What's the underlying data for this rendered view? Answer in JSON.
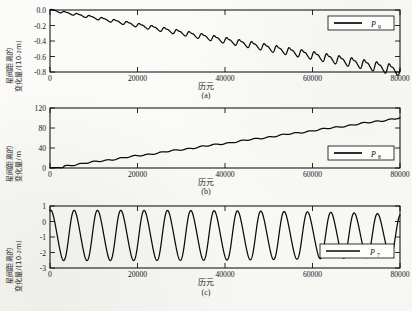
{
  "figure": {
    "background": "#fbfbf9",
    "line_color": "#0a0a0a",
    "xlabel": "历元",
    "captions": {
      "a": "(a)",
      "b": "(b)",
      "c": "(c)"
    }
  },
  "axis": {
    "xticks": [
      "0",
      "20000",
      "40000",
      "60000",
      "80000"
    ],
    "xlim": [
      0,
      80000
    ]
  },
  "panels": {
    "a": {
      "caption": "(a)",
      "xlabel": "历元",
      "ylabel_line1": "星间距离的",
      "ylabel_line2_prefix": "变化量/(10",
      "ylabel_line2_exp": "-2",
      "ylabel_line2_suffix": "m)",
      "yticks": [
        "0.0",
        "-0.2",
        "-0.4",
        "-0.6",
        "-0.8"
      ],
      "legend": {
        "symbol": "P",
        "subscript": "9"
      }
    },
    "b": {
      "caption": "(b)",
      "xlabel": "历元",
      "ylabel_line1": "星间距离的",
      "ylabel_line2_prefix": "变化量/m",
      "ylabel_line2_exp": "",
      "ylabel_line2_suffix": "",
      "yticks": [
        "120",
        "80",
        "40",
        "0"
      ],
      "legend": {
        "symbol": "P",
        "subscript": "8"
      }
    },
    "c": {
      "caption": "(c)",
      "xlabel": "历元",
      "ylabel_line1": "星间距离的",
      "ylabel_line2_prefix": "变化量/(10",
      "ylabel_line2_exp": "-2",
      "ylabel_line2_suffix": "m)",
      "yticks": [
        "1",
        "0",
        "-1",
        "-2",
        "-3"
      ],
      "legend": {
        "symbol": "P",
        "subscript": "7"
      }
    }
  },
  "chart_data": [
    {
      "type": "line",
      "panel": "a",
      "title": "",
      "xlabel": "历元",
      "ylabel": "星间距离的变化量/(10^-2 m)",
      "xlim": [
        0,
        80000
      ],
      "ylim": [
        -0.8,
        0.0
      ],
      "xticks": [
        0,
        20000,
        40000,
        60000,
        80000
      ],
      "yticks": [
        0.0,
        -0.2,
        -0.4,
        -0.6,
        -0.8
      ],
      "grid": false,
      "legend": [
        "P9"
      ],
      "legend_position": "upper right",
      "description": "Secularly decreasing signal with superimposed growing-amplitude periodic oscillation (~28 cycles over 80000 epochs), drifting from 0.0 to about -0.78.",
      "series": [
        {
          "name": "P9",
          "trend_slope_per_epoch": -9.3e-06,
          "oscillation_cycles": 28,
          "amplitude_start": 0.012,
          "amplitude_end": 0.07,
          "x": [
            0,
            5000,
            10000,
            15000,
            20000,
            25000,
            30000,
            35000,
            40000,
            45000,
            50000,
            55000,
            60000,
            65000,
            70000,
            75000,
            80000
          ],
          "values": [
            -0.01,
            -0.07,
            -0.12,
            -0.17,
            -0.22,
            -0.26,
            -0.31,
            -0.36,
            -0.41,
            -0.46,
            -0.51,
            -0.56,
            -0.61,
            -0.66,
            -0.7,
            -0.74,
            -0.78
          ]
        }
      ]
    },
    {
      "type": "line",
      "panel": "b",
      "title": "",
      "xlabel": "历元",
      "ylabel": "星间距离的变化量/m",
      "xlim": [
        0,
        80000
      ],
      "ylim": [
        0,
        120
      ],
      "xticks": [
        0,
        20000,
        40000,
        60000,
        80000
      ],
      "yticks": [
        0,
        40,
        80,
        120
      ],
      "grid": false,
      "legend": [
        "P8"
      ],
      "legend_position": "lower right",
      "description": "Nearly linear secular growth from 0 to about 100 m with small ripples.",
      "series": [
        {
          "name": "P8",
          "x": [
            0,
            5000,
            10000,
            15000,
            20000,
            25000,
            30000,
            35000,
            40000,
            45000,
            50000,
            55000,
            60000,
            65000,
            70000,
            75000,
            80000
          ],
          "values": [
            0,
            5,
            11,
            17,
            24,
            30,
            37,
            43,
            50,
            56,
            62,
            68,
            75,
            81,
            88,
            94,
            100
          ]
        }
      ]
    },
    {
      "type": "line",
      "panel": "c",
      "title": "",
      "xlabel": "历元",
      "ylabel": "星间距离的变化量/(10^-2 m)",
      "xlim": [
        0,
        80000
      ],
      "ylim": [
        -3,
        1
      ],
      "xticks": [
        0,
        20000,
        40000,
        60000,
        80000
      ],
      "yticks": [
        1,
        0,
        -1,
        -2,
        -3
      ],
      "grid": false,
      "legend": [
        "P7"
      ],
      "legend_position": "lower right",
      "description": "Steady large periodic oscillation about a mean of roughly -0.9, peaks near +0.75 and troughs near -2.45, about 15 cycles across 80000 epochs, amplitude slightly decaying near the end.",
      "series": [
        {
          "name": "P7",
          "mean": -0.9,
          "amplitude": 1.6,
          "cycles": 15,
          "peak_max": 0.78,
          "trough_min": -2.45
        }
      ]
    }
  ]
}
